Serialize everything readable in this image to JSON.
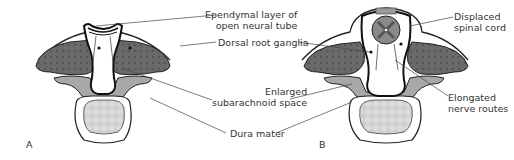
{
  "diagram": {
    "panels": [
      {
        "id": "A",
        "label": "A"
      },
      {
        "id": "B",
        "label": "B"
      }
    ],
    "labels": {
      "ependymal_line1": "Ependymal layer of",
      "ependymal_line2": "open neural tube",
      "dorsal_root_ganglia": "Dorsal root ganglia",
      "enlarged_line1": "Enlarged",
      "enlarged_line2": "subarachnoid space",
      "dura_mater": "Dura mater",
      "displaced_line1": "Displaced",
      "displaced_line2": "spinal cord",
      "elongated_line1": "Elongated",
      "elongated_line2": "nerve routes"
    },
    "colors": {
      "ganglia": "#6a6a6a",
      "lamina": "#a8a8a8",
      "vertebral_body": "#d8d8d8",
      "cord_gray": "#7a7a7a",
      "outline": "#222222",
      "leader_line": "#444444"
    }
  }
}
